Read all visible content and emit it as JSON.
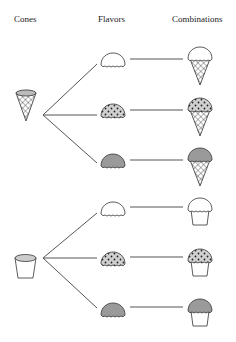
{
  "headers": {
    "cones": "Cones",
    "flavors": "Flavors",
    "combinations": "Combinations"
  },
  "cones": [
    {
      "name": "waffle-cone",
      "icon": "cone-icon"
    },
    {
      "name": "cup",
      "icon": "cup-icon"
    }
  ],
  "flavors": [
    {
      "name": "vanilla",
      "style": "white",
      "color": "#ffffff"
    },
    {
      "name": "chip",
      "style": "dotted",
      "color": "#cfcfcf"
    },
    {
      "name": "chocolate",
      "style": "dark",
      "color": "#9a9a9a"
    }
  ],
  "combinations": [
    "cone + white scoop",
    "cone + dotted scoop",
    "cone + dark scoop",
    "cup + white scoop",
    "cup + dotted scoop",
    "cup + dark scoop"
  ],
  "colors": {
    "line": "#555555",
    "outline": "#333333",
    "grey_fill": "#9a9a9a",
    "light_fill": "#d0d0d0"
  }
}
